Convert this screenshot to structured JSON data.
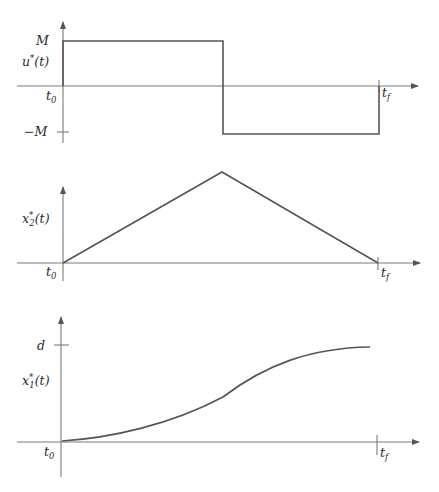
{
  "figure": {
    "panels": [
      {
        "id": "control",
        "ylabel": "u*(t)",
        "ylabel_main": "u",
        "ylabel_sup": "*",
        "ylabel_arg": "(t)",
        "ytick_top": "M",
        "ytick_bottom": "−M",
        "x_start": "t",
        "x_start_sub": "0",
        "x_end": "t",
        "x_end_sub": "f",
        "description": "Bang-bang control: +M from t0 to switching time, then −M until tf"
      },
      {
        "id": "velocity",
        "ylabel_main": "x",
        "ylabel_sup": "*",
        "ylabel_sub": "2",
        "ylabel_arg": "(t)",
        "x_start": "t",
        "x_start_sub": "0",
        "x_end": "t",
        "x_end_sub": "f",
        "description": "Triangular profile rising linearly to peak at switching time then falling to zero at tf"
      },
      {
        "id": "position",
        "ylabel_main": "x",
        "ylabel_sup": "*",
        "ylabel_sub": "1",
        "ylabel_arg": "(t)",
        "ytick_top": "d",
        "x_start": "t",
        "x_start_sub": "0",
        "x_end": "t",
        "x_end_sub": "f",
        "description": "S-shaped curve from 0 to d, inflection at switching time"
      }
    ]
  },
  "colors": {
    "axis": "#7a7a7a",
    "curve": "#555555",
    "text": "#2a2a2a",
    "background": "#ffffff"
  }
}
